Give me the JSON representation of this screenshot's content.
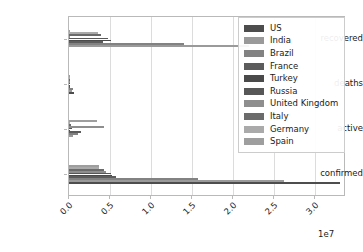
{
  "chart_data": {
    "type": "bar",
    "orientation": "horizontal",
    "title": "",
    "xlabel": "",
    "ylabel": "",
    "categories": [
      "recovered",
      "deaths",
      "active",
      "confirmed"
    ],
    "xlim": [
      0,
      33800000
    ],
    "xticks": [
      0,
      5000000,
      10000000,
      15000000,
      20000000,
      25000000,
      30000000
    ],
    "xtick_labels": [
      "0.0",
      "0.5",
      "1.0",
      "1.5",
      "2.0",
      "2.5",
      "3.0"
    ],
    "offset_text": "1e7",
    "grid": true,
    "grid_axis": "x",
    "legend_position": "upper right",
    "series": [
      {
        "name": "US",
        "color": "#4d4d4d",
        "values": {
          "recovered": 0,
          "deaths": 620000,
          "active": 0,
          "confirmed": 33100000
        }
      },
      {
        "name": "India",
        "color": "#9a9a9a",
        "values": {
          "recovered": 22000000,
          "deaths": 330000,
          "active": 480000,
          "confirmed": 26200000
        }
      },
      {
        "name": "Brazil",
        "color": "#828282",
        "values": {
          "recovered": 14000000,
          "deaths": 450000,
          "active": 1060000,
          "confirmed": 15800000
        }
      },
      {
        "name": "France",
        "color": "#5c5c5c",
        "values": {
          "recovered": 4100000,
          "deaths": 110000,
          "active": 1500000,
          "confirmed": 5700000
        }
      },
      {
        "name": "Turkey",
        "color": "#4a4a4a",
        "values": {
          "recovered": 5100000,
          "deaths": 47000,
          "active": 110000,
          "confirmed": 5300000
        }
      },
      {
        "name": "Russia",
        "color": "#575757",
        "values": {
          "recovered": 4700000,
          "deaths": 125000,
          "active": 330000,
          "confirmed": 5100000
        }
      },
      {
        "name": "United Kingdom",
        "color": "#8e8e8e",
        "values": {
          "recovered": 14500,
          "deaths": 128000,
          "active": 4300000,
          "confirmed": 4500000
        }
      },
      {
        "name": "Italy",
        "color": "#6b6b6b",
        "values": {
          "recovered": 3900000,
          "deaths": 126000,
          "active": 210000,
          "confirmed": 4230000
        }
      },
      {
        "name": "Germany",
        "color": "#aaaaaa",
        "values": {
          "recovered": 3530000,
          "deaths": 89000,
          "active": 100000,
          "confirmed": 3700000
        }
      },
      {
        "name": "Spain",
        "color": "#9e9e9e",
        "values": {
          "recovered": 150000,
          "deaths": 80000,
          "active": 3360000,
          "confirmed": 3640000
        }
      }
    ]
  },
  "axes": {
    "ytick_labels": [
      "recovered",
      "deaths",
      "active",
      "confirmed"
    ],
    "xtick_labels": [
      "0.0",
      "0.5",
      "1.0",
      "1.5",
      "2.0",
      "2.5",
      "3.0"
    ],
    "offset_text": "1e7"
  },
  "legend": {
    "entries": [
      {
        "label": "US"
      },
      {
        "label": "India"
      },
      {
        "label": "Brazil"
      },
      {
        "label": "France"
      },
      {
        "label": "Turkey"
      },
      {
        "label": "Russia"
      },
      {
        "label": "United Kingdom"
      },
      {
        "label": "Italy"
      },
      {
        "label": "Germany"
      },
      {
        "label": "Spain"
      }
    ]
  }
}
